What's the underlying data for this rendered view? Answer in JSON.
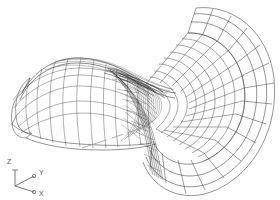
{
  "view": {
    "background_color": "#ffffff",
    "line_color": "#3a3a3a",
    "hidden_line_color": "#9a9a9a",
    "width": 280,
    "height": 200
  },
  "axis_triad": {
    "name": "coordinate-axis-triad",
    "origin_label": "",
    "axes": [
      {
        "id": "z",
        "label": "Z",
        "label_x": 9,
        "label_y": 161
      },
      {
        "id": "y",
        "label": "Y",
        "label_x": 40,
        "label_y": 173
      },
      {
        "id": "x",
        "label": "X",
        "label_x": 41,
        "label_y": 196
      }
    ],
    "color": "#666666"
  },
  "geometry": {
    "title": "",
    "objects": [
      {
        "name": "bell-flare-surface",
        "description": "flared trumpet-bell wireframe mesh"
      },
      {
        "name": "saddle-surface",
        "description": "hyperbolic saddle arch surface"
      },
      {
        "name": "construction-line",
        "description": "dashed hidden construction edge"
      }
    ]
  }
}
